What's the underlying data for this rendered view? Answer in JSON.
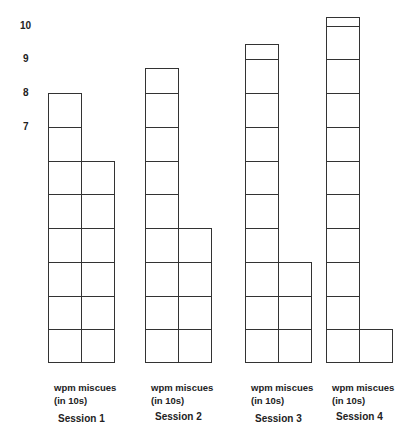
{
  "chart_data": {
    "type": "bar",
    "style": "stacked-unit-cells",
    "title": "",
    "xlabel": "",
    "ylabel": "",
    "y_ticks": [
      "7",
      "8",
      "9",
      "10"
    ],
    "ylim": [
      0,
      10.5
    ],
    "grid": false,
    "legend": null,
    "categories": [
      "Session 1",
      "Session 2",
      "Session 3",
      "Session 4"
    ],
    "bar_label_line1": "wpm miscues",
    "bar_label_line2": "(in 10s)",
    "series": [
      {
        "name": "wpm",
        "values": [
          8,
          8.75,
          9.45,
          10.25
        ]
      },
      {
        "name": "miscues",
        "values": [
          6,
          4,
          3,
          1
        ]
      }
    ]
  },
  "layout": {
    "base_y": 363,
    "unit_px": 33.75,
    "col_width": 33,
    "sessions_x": [
      48,
      145,
      245,
      326
    ]
  }
}
